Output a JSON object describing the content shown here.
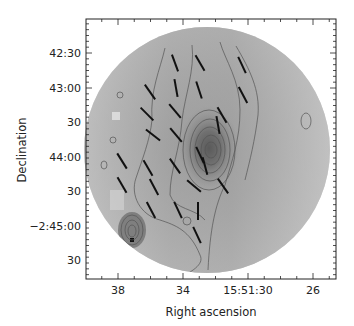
{
  "chart_data": {
    "type": "heatmap",
    "subtype": "polarization map with intensity contours",
    "title": "",
    "xlabel": "Right ascension",
    "ylabel": "Declination",
    "x_ticks": [
      "38",
      "34",
      "15:51:30",
      "26"
    ],
    "y_ticks": [
      "42:30",
      "43:00",
      "30",
      "44:00",
      "30",
      "−2:45:00",
      "30"
    ],
    "x_tick_positions_px": [
      118,
      183,
      248,
      313
    ],
    "y_tick_positions_px": [
      53,
      88,
      122,
      157,
      191,
      226,
      260
    ],
    "frame_px": {
      "left": 86,
      "top": 19,
      "right": 336,
      "bottom": 279
    },
    "map_center_px": [
      207,
      150
    ],
    "map_radius_px": 123,
    "colormap": "grayscale",
    "grid": false,
    "legend": null,
    "peak_position_px": [
      211,
      150
    ],
    "contours": {
      "levels": 7,
      "description": "nested contours around central peak near RA 15:51:31, Dec -2:43:55; secondary compact peak at lower left near RA 15:51:37, Dec -2:45:05"
    },
    "vectors": [
      {
        "x": 175,
        "y": 63,
        "angle_deg": -70
      },
      {
        "x": 200,
        "y": 63,
        "angle_deg": -60
      },
      {
        "x": 242,
        "y": 65,
        "angle_deg": -65
      },
      {
        "x": 150,
        "y": 92,
        "angle_deg": -55
      },
      {
        "x": 176,
        "y": 88,
        "angle_deg": -80
      },
      {
        "x": 199,
        "y": 90,
        "angle_deg": -72
      },
      {
        "x": 243,
        "y": 95,
        "angle_deg": -62
      },
      {
        "x": 147,
        "y": 114,
        "angle_deg": -45
      },
      {
        "x": 175,
        "y": 111,
        "angle_deg": -50
      },
      {
        "x": 222,
        "y": 115,
        "angle_deg": -60
      },
      {
        "x": 176,
        "y": 135,
        "angle_deg": -50
      },
      {
        "x": 153,
        "y": 135,
        "angle_deg": -38
      },
      {
        "x": 218,
        "y": 125,
        "angle_deg": -80
      },
      {
        "x": 200,
        "y": 155,
        "angle_deg": -65
      },
      {
        "x": 148,
        "y": 168,
        "angle_deg": -60
      },
      {
        "x": 175,
        "y": 166,
        "angle_deg": -55
      },
      {
        "x": 205,
        "y": 166,
        "angle_deg": -75
      },
      {
        "x": 122,
        "y": 161,
        "angle_deg": -58
      },
      {
        "x": 194,
        "y": 186,
        "angle_deg": -40
      },
      {
        "x": 223,
        "y": 186,
        "angle_deg": -55
      },
      {
        "x": 122,
        "y": 185,
        "angle_deg": -60
      },
      {
        "x": 154,
        "y": 187,
        "angle_deg": -62
      },
      {
        "x": 178,
        "y": 210,
        "angle_deg": -65
      },
      {
        "x": 198,
        "y": 211,
        "angle_deg": 90
      },
      {
        "x": 151,
        "y": 210,
        "angle_deg": -62
      },
      {
        "x": 197,
        "y": 235,
        "angle_deg": -65
      }
    ]
  }
}
